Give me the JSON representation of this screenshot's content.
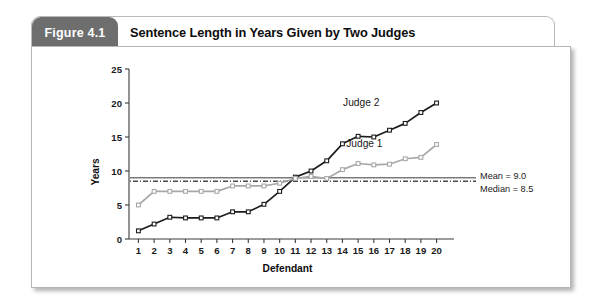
{
  "figure": {
    "tag": "Figure 4.1",
    "title": "Sentence Length in Years Given by Two Judges"
  },
  "chart_data": {
    "type": "line",
    "title": "Sentence Length in Years Given by Two Judges",
    "xlabel": "Defendant",
    "ylabel": "Years",
    "x": [
      1,
      2,
      3,
      4,
      5,
      6,
      7,
      8,
      9,
      10,
      11,
      12,
      13,
      14,
      15,
      16,
      17,
      18,
      19,
      20
    ],
    "categories": [
      "1",
      "2",
      "3",
      "4",
      "5",
      "6",
      "7",
      "8",
      "9",
      "10",
      "11",
      "12",
      "13",
      "14",
      "15",
      "16",
      "17",
      "18",
      "19",
      "20"
    ],
    "xlim": [
      0.4,
      20.6
    ],
    "ylim": [
      0,
      25
    ],
    "yticks": [
      0,
      5,
      10,
      15,
      20,
      25
    ],
    "xticks": [
      1,
      2,
      3,
      4,
      5,
      6,
      7,
      8,
      9,
      10,
      11,
      12,
      13,
      14,
      15,
      16,
      17,
      18,
      19,
      20
    ],
    "grid": false,
    "legend": "inline-labels",
    "series": [
      {
        "name": "Judge 2",
        "color": "#1c1c1c",
        "marker": "square",
        "label_x": 15.2,
        "label_y": 19.6,
        "values": [
          1.2,
          2.2,
          3.2,
          3.1,
          3.1,
          3.1,
          4.0,
          4.0,
          5.1,
          7.0,
          9.1,
          10.0,
          11.5,
          14.0,
          15.1,
          15.0,
          16.0,
          17.0,
          18.6,
          20.0
        ]
      },
      {
        "name": "Judge 1",
        "color": "#a8a8a8",
        "marker": "square",
        "label_x": 15.4,
        "label_y": 13.6,
        "values": [
          5.0,
          7.0,
          7.0,
          7.0,
          7.0,
          7.0,
          7.8,
          7.8,
          7.8,
          8.2,
          8.9,
          9.2,
          8.9,
          10.2,
          11.1,
          10.9,
          11.0,
          11.8,
          12.0,
          13.9
        ]
      }
    ],
    "reference_lines": [
      {
        "name": "Mean",
        "label": "Mean = 9.0",
        "value": 9.0,
        "style": "solid",
        "color": "#7a7a7a"
      },
      {
        "name": "Median",
        "label": "Median = 8.5",
        "value": 8.5,
        "style": "dash-dot",
        "color": "#4a4a4a"
      }
    ]
  }
}
